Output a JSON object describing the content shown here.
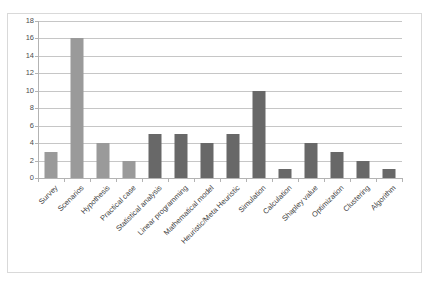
{
  "chart_data": {
    "type": "bar",
    "title": "",
    "subtitle": "",
    "xlabel": "",
    "ylabel": "",
    "ylim": [
      0,
      18
    ],
    "ytick_step": 2,
    "yticks": [
      0,
      2,
      4,
      6,
      8,
      10,
      12,
      14,
      16,
      18
    ],
    "grid": "horizontal",
    "legend": "none",
    "categories": [
      "Survey",
      "Scenarios",
      "Hypothesis",
      "Practical case",
      "Statistical analysis",
      "Linear programming",
      "Mathematical model",
      "Heuristic/Meta Heuristic",
      "Simulation",
      "Calculation",
      "Shapley value",
      "Optimization",
      "Clustering",
      "Algorithm"
    ],
    "values": [
      3,
      16,
      4,
      2,
      5,
      5,
      4,
      5,
      10,
      1,
      4,
      3,
      2,
      1
    ],
    "bar_colors": [
      "#9a9a9a",
      "#9a9a9a",
      "#9a9a9a",
      "#9a9a9a",
      "#686868",
      "#686868",
      "#686868",
      "#686868",
      "#686868",
      "#686868",
      "#686868",
      "#686868",
      "#686868",
      "#686868"
    ]
  },
  "style": {
    "plot_background": "#ffffff",
    "frame_border": "#d9d9d9",
    "gridline_color": "#c6c6c6",
    "axis_color": "#b3b3b3",
    "tick_label_color": "#4d4d4d",
    "category_label_color": "#3f3f3f"
  }
}
